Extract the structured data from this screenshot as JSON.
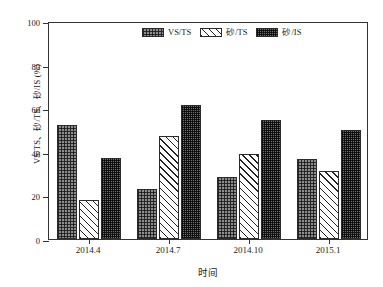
{
  "chart_data": {
    "type": "bar",
    "title": "",
    "xlabel": "时间",
    "ylabel": "VS/TS、砂/TS、砂/IS (%)",
    "categories": [
      "2014.4",
      "2014.7",
      "2014.10",
      "2015.1"
    ],
    "series": [
      {
        "name": "VS/TS",
        "pattern": "checker",
        "values": [
          52.3,
          22.8,
          28.4,
          36.8
        ]
      },
      {
        "name": "砂/TS",
        "pattern": "diagonal",
        "values": [
          17.9,
          47.3,
          39.0,
          31.0
        ]
      },
      {
        "name": "砂/IS",
        "pattern": "dense-grid",
        "values": [
          37.2,
          61.7,
          54.4,
          49.8
        ]
      }
    ],
    "ylim": [
      0,
      100
    ],
    "yticks": [
      0,
      20,
      40,
      60,
      80,
      100
    ],
    "ytick_labels": [
      "0",
      "20",
      "40",
      "60",
      "80",
      "100"
    ],
    "grid": false,
    "legend_position": "top-center",
    "legend": [
      "VS/TS",
      "砂/TS",
      "砂/IS"
    ],
    "frame": "box",
    "colors": {
      "axis": "#333333",
      "bar_edge": "#2b2b2b",
      "series_fill": [
        "#8d8d8d",
        "#ffffff",
        "#6e6e6e"
      ],
      "background": "#ffffff"
    }
  }
}
